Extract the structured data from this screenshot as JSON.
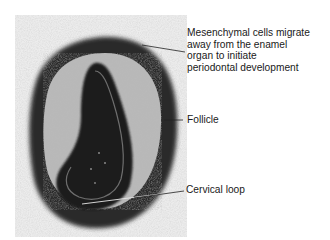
{
  "figure": {
    "image_description": "micrograph-tooth-germ-bell-stage",
    "labels": [
      {
        "id": "mesenchymal",
        "lines": [
          "Mesenchymal cells migrate",
          "away from the enamel",
          "organ to initiate",
          "periodontal development"
        ]
      },
      {
        "id": "follicle",
        "text": "Follicle"
      },
      {
        "id": "cervical",
        "text": "Cervical loop"
      }
    ]
  }
}
